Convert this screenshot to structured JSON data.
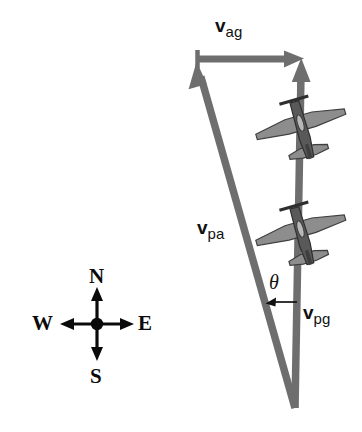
{
  "figure": {
    "kind": "vector-diagram",
    "title_visible": false,
    "background_color": "#ffffff",
    "vector_color": "#6e6e6e",
    "plane_body_color": "#4a4a4a",
    "plane_wing_color": "#8a8a8a",
    "ink_color": "#111111"
  },
  "vectors": {
    "air_ground": {
      "symbol": "v",
      "subscript": "ag",
      "description": "velocity of air relative to ground",
      "from": [
        197,
        59
      ],
      "to": [
        301,
        59
      ],
      "direction": "east"
    },
    "plane_air": {
      "symbol": "v",
      "subscript": "pa",
      "description": "velocity of plane relative to air",
      "from": [
        295,
        408
      ],
      "to": [
        197,
        62
      ],
      "direction": "north-northwest"
    },
    "plane_ground": {
      "symbol": "v",
      "subscript": "pg",
      "description": "velocity of plane relative to ground",
      "from": [
        295,
        408
      ],
      "to": [
        301,
        60
      ],
      "direction": "north"
    }
  },
  "angle": {
    "symbol": "θ",
    "description": "angle between v_pa and v_pg"
  },
  "compass": {
    "north": "N",
    "south": "S",
    "east": "E",
    "west": "W",
    "center": [
      97,
      324
    ]
  },
  "airplanes": [
    {
      "id": "upper",
      "center": [
        301,
        125
      ],
      "heading": "north-northwest"
    },
    {
      "id": "lower",
      "center": [
        301,
        231
      ],
      "heading": "north-northwest"
    }
  ]
}
